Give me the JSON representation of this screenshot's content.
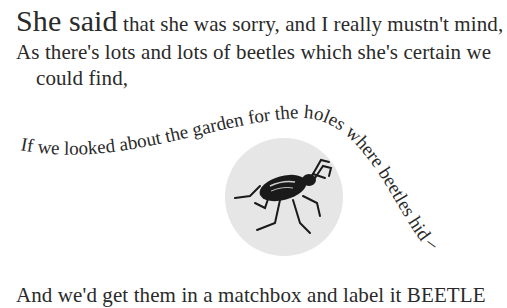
{
  "poem": {
    "line1_lead": "She said",
    "line1_rest": " that she was sorry, and I really mustn't mind,",
    "line2": "As there's lots and lots of beetles which she's certain we",
    "line3": "could find,",
    "curved_line": "If we looked about the garden for the holes where beetles hid –",
    "line5": "And we'd get them in a matchbox and label it BEETLE"
  },
  "illustration": {
    "subject": "beetle-illustration",
    "background": "#e6e6e6"
  }
}
